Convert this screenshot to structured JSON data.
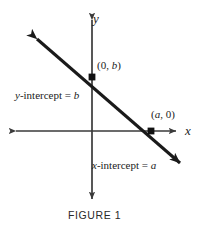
{
  "figure": {
    "caption": "FIGURE 1",
    "axis_labels": {
      "x": "x",
      "y": "y"
    },
    "point_labels": {
      "y_intercept_point": "(0, b)",
      "x_intercept_point": "(a, 0)"
    },
    "annotations": {
      "y_intercept_text": "y-intercept = b",
      "x_intercept_text": "x-intercept = a"
    },
    "colors": {
      "line": "#1a1a1a",
      "axis": "#3a3a3a",
      "text": "#1b1b1b",
      "background": "#ffffff"
    }
  },
  "chart_data": {
    "type": "line",
    "title": "FIGURE 1",
    "xlabel": "x",
    "ylabel": "y",
    "grid": false,
    "legend": null,
    "origin_px": [
      92,
      131
    ],
    "xlim": [
      -78,
      122
    ],
    "ylim": [
      -69,
      131
    ],
    "series": [
      {
        "name": "line through intercepts",
        "points_px": [
          [
            35,
            37
          ],
          [
            182,
            165
          ]
        ],
        "slope_px": -0.871,
        "arrow_start": true,
        "arrow_end": true
      }
    ],
    "points": [
      {
        "label": "(0, b)",
        "x": 0,
        "y": "b",
        "px": [
          92,
          77
        ],
        "marker": "square"
      },
      {
        "label": "(a, 0)",
        "x": "a",
        "y": 0,
        "px": [
          151,
          131
        ],
        "marker": "square"
      }
    ],
    "annotations": [
      {
        "text": "y-intercept = b",
        "px": [
          16,
          96
        ]
      },
      {
        "text": "x-intercept = a",
        "px": [
          93,
          166
        ]
      },
      {
        "text": "(0, b)",
        "px": [
          97,
          67
        ]
      },
      {
        "text": "(a, 0)",
        "px": [
          152,
          116
        ]
      }
    ],
    "axes": {
      "x_axis_px": {
        "from": [
          14,
          131
        ],
        "to": [
          178,
          131
        ],
        "arrows": "both"
      },
      "y_axis_px": {
        "from": [
          92,
          18
        ],
        "to": [
          92,
          201
        ],
        "arrows": "both"
      }
    }
  }
}
